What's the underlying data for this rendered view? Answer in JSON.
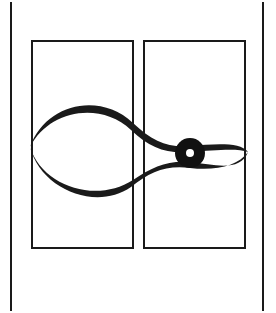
{
  "figure": {
    "title": "Eye and Infinity Emblem",
    "kind": "logo-mark",
    "canvas": {
      "width": 276,
      "height": 313
    },
    "background_color": "#ffffff",
    "ink_color": "#1a1a1a"
  },
  "margin_rules": {
    "name": "vertical-margin-rules",
    "color": "#1a1a1a",
    "stroke_width": 2,
    "left": {
      "x": 11,
      "y1": 2,
      "y2": 311
    },
    "right": {
      "x": 263,
      "y1": 2,
      "y2": 311
    }
  },
  "panels": [
    {
      "name": "left-panel",
      "label": "Left Panel",
      "x": 32,
      "y": 41,
      "width": 101,
      "height": 207,
      "stroke_width": 2,
      "stroke_color": "#1a1a1a",
      "fill": "none",
      "contains": "empty-lens"
    },
    {
      "name": "right-panel",
      "label": "Right Panel",
      "x": 144,
      "y": 41,
      "width": 101,
      "height": 207,
      "stroke_width": 2,
      "stroke_color": "#1a1a1a",
      "fill": "none",
      "contains": "eye-with-pupil"
    }
  ],
  "curves": {
    "crossing_point": {
      "x": 138,
      "y": 151
    },
    "left_tip": {
      "x": 30,
      "y": 147
    },
    "right_tip": {
      "x": 248,
      "y": 152
    },
    "upper_peak_y": 104,
    "lower_trough_y": 197,
    "stroke_color": "#1a1a1a",
    "strokes": [
      {
        "name": "upper-sweep",
        "description": "Upper arc of the left lens continuing through the crossing into the upper lid of the right eye",
        "path": "M 30 147 C 46 103 100 92 133 123 C 152 141 168 148 190 146 C 216 144 238 142 248 152",
        "max_width": 9
      },
      {
        "name": "lower-sweep",
        "description": "Lower arc of the left lens continuing through the crossing into the lower lid of the right eye",
        "path": "M 30 147 C 42 185 96 203 133 180 C 152 168 168 161 190 163 C 216 166 238 172 248 152",
        "max_width": 9
      }
    ]
  },
  "pupil": {
    "name": "pupil",
    "label": "Pupil",
    "center": {
      "x": 190,
      "y": 153
    },
    "outer_radius": 15,
    "inner_radius": 4,
    "outer_color": "#111111",
    "inner_color": "#ffffff",
    "shape": "annulus"
  }
}
